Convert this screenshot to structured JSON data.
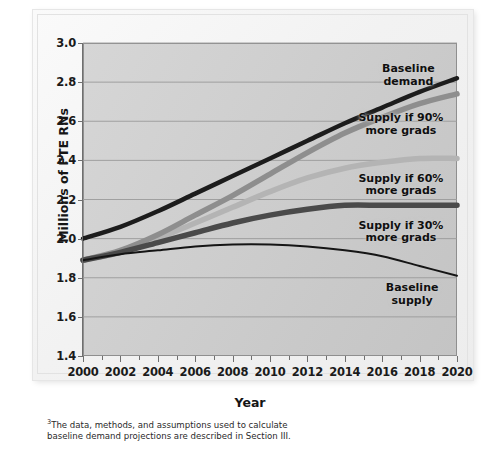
{
  "figure": {
    "title_partial": "",
    "axis_title_y": "Millions of FTE RNs",
    "axis_title_x": "Year",
    "footnote_marker": "3",
    "footnote": "The data, methods, and assumptions used to calculate baseline demand projections are described in Section III."
  },
  "labels": {
    "baseline_demand": "Baseline\ndemand",
    "supply_90": "Supply if 90%\nmore grads",
    "supply_60": "Supply if 60%\nmore grads",
    "supply_30": "Supply if 30%\nmore grads",
    "baseline_supply": "Baseline\nsupply"
  },
  "colors": {
    "plot_background": "#cdcdcd",
    "axis": "#6f6f6f",
    "gridline": "#9a9a9a",
    "baseline_demand": "#1c1c1c",
    "supply_90": "#8e8e8e",
    "supply_60": "#b4b4b4",
    "supply_30": "#4a4a4a",
    "baseline_supply": "#151515",
    "band_light": "#d9d9d9"
  },
  "chart_data": {
    "type": "line",
    "title": "",
    "xlabel": "Year",
    "ylabel": "Millions of FTE RNs",
    "xlim": [
      2000,
      2020
    ],
    "ylim": [
      1.4,
      3.0
    ],
    "xticks": [
      2000,
      2002,
      2004,
      2006,
      2008,
      2010,
      2012,
      2014,
      2016,
      2018,
      2020
    ],
    "xtick_labels": [
      "2000",
      "2002",
      "2004",
      "2006",
      "2008",
      "2010",
      "2012",
      "2014",
      "2016",
      "2018",
      "2020"
    ],
    "minor_xticks": [
      2001,
      2003,
      2005,
      2007,
      2009,
      2011,
      2013,
      2015,
      2017,
      2019
    ],
    "yticks": [
      1.4,
      1.6,
      1.8,
      2.0,
      2.2,
      2.4,
      2.6,
      2.8,
      3.0
    ],
    "ytick_labels": [
      "1.4",
      "1.6",
      "1.8",
      "2.0",
      "2.2",
      "2.4",
      "2.6",
      "2.8",
      "3.0"
    ],
    "grid": true,
    "grid_axis": "y",
    "legend": "inline-annotations",
    "legend_position": "right-inside",
    "x": [
      2000,
      2002,
      2004,
      2006,
      2008,
      2010,
      2012,
      2014,
      2016,
      2018,
      2020
    ],
    "series": [
      {
        "name": "Baseline demand",
        "color": "#1c1c1c",
        "width": 4.5,
        "values": [
          2.0,
          2.06,
          2.14,
          2.23,
          2.32,
          2.41,
          2.5,
          2.59,
          2.67,
          2.75,
          2.82
        ]
      },
      {
        "name": "Supply if 90% more grads",
        "color": "#8e8e8e",
        "width": 5.5,
        "values": [
          1.89,
          1.94,
          2.02,
          2.12,
          2.22,
          2.33,
          2.44,
          2.54,
          2.62,
          2.69,
          2.74
        ]
      },
      {
        "name": "Supply if 60% more grads",
        "color": "#b4b4b4",
        "width": 5.5,
        "values": [
          1.89,
          1.93,
          2.0,
          2.08,
          2.16,
          2.24,
          2.31,
          2.36,
          2.39,
          2.41,
          2.41
        ]
      },
      {
        "name": "Supply if 30% more grads",
        "color": "#4a4a4a",
        "width": 5.5,
        "values": [
          1.89,
          1.93,
          1.98,
          2.03,
          2.08,
          2.12,
          2.15,
          2.17,
          2.17,
          2.17,
          2.17
        ]
      },
      {
        "name": "Baseline supply",
        "color": "#151515",
        "width": 2.0,
        "values": [
          1.89,
          1.92,
          1.94,
          1.96,
          1.97,
          1.97,
          1.96,
          1.94,
          1.91,
          1.86,
          1.81
        ]
      }
    ],
    "annotations": [
      {
        "text": "Baseline demand",
        "x": 2017.4,
        "y": 2.86
      },
      {
        "text": "Supply if 90% more grads",
        "x": 2017.0,
        "y": 2.61
      },
      {
        "text": "Supply if 60% more grads",
        "x": 2017.0,
        "y": 2.3
      },
      {
        "text": "Supply if 30% more grads",
        "x": 2017.0,
        "y": 2.06
      },
      {
        "text": "Baseline supply",
        "x": 2017.6,
        "y": 1.74
      }
    ]
  }
}
